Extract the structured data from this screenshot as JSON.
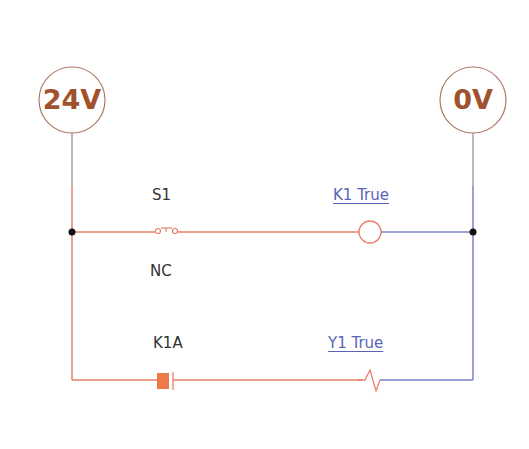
{
  "diagram": {
    "type": "ladder-logic",
    "rails": {
      "left": {
        "label": "24V",
        "color": "#a0522d"
      },
      "right": {
        "label": "0V",
        "color": "#a0522d"
      }
    },
    "rungs": [
      {
        "contact": {
          "name": "S1",
          "type": "NC",
          "state_label": "NC"
        },
        "output": {
          "name": "K1",
          "type": "coil",
          "status": "K1 True"
        }
      },
      {
        "contact": {
          "name": "K1A",
          "type": "contact"
        },
        "output": {
          "name": "Y1",
          "type": "solenoid",
          "status": "Y1 True"
        }
      }
    ],
    "colors": {
      "energized_wire": "#e8806a",
      "neutral_wire": "#7b82c8",
      "junction": "#111111",
      "text": "#333333",
      "status_text": "#5a63b8"
    }
  }
}
